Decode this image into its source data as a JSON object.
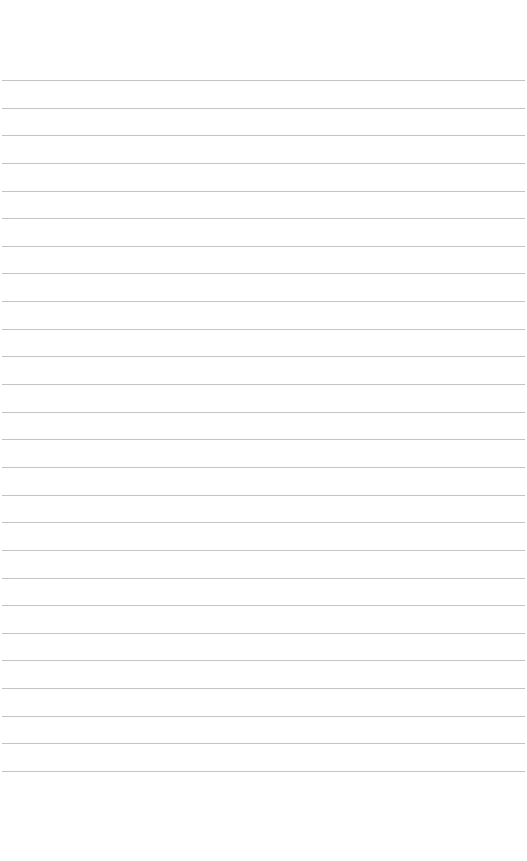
{
  "page": {
    "type": "lined-paper",
    "line_color": "#c4c4c4",
    "background": "#ffffff",
    "line_count": 26,
    "first_line_y": 80,
    "line_spacing": 27.64
  }
}
